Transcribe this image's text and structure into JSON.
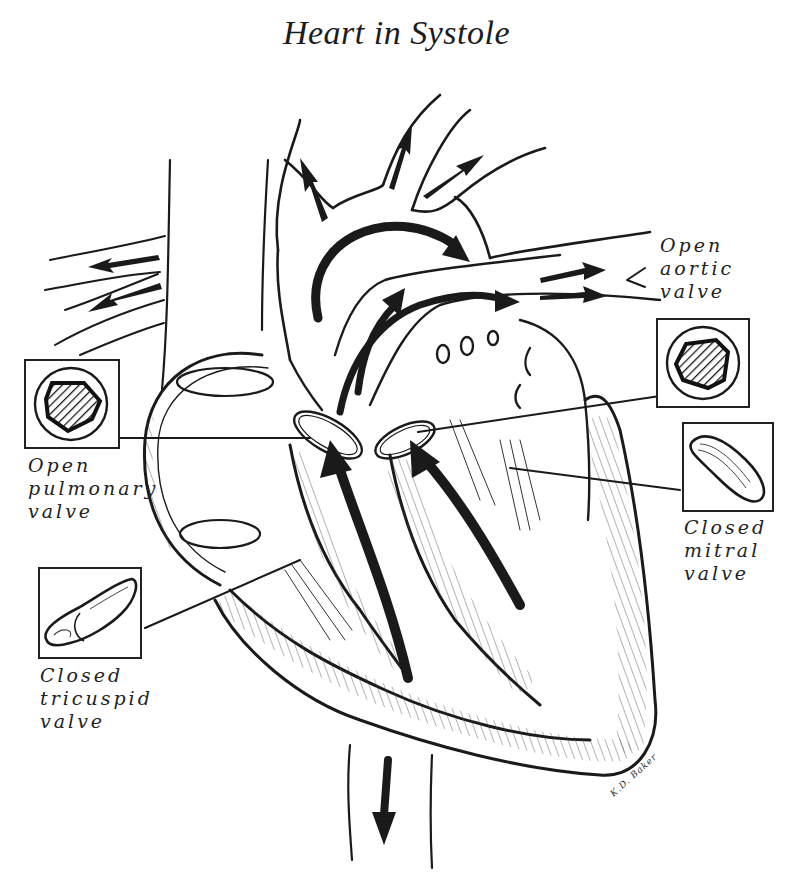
{
  "title": "Heart in Systole",
  "labels": {
    "aortic": [
      "Open",
      "aortic",
      "valve"
    ],
    "pulmonary": [
      "Open",
      "pulmonary",
      "valve"
    ],
    "mitral": [
      "Closed",
      "mitral",
      "valve"
    ],
    "tricuspid": [
      "Closed",
      "tricuspid",
      "valve"
    ]
  },
  "insets": {
    "aortic": "open-aortic-valve-cross-section",
    "pulmonary": "open-pulmonary-valve-cross-section",
    "mitral": "closed-mitral-valve-leaflet",
    "tricuspid": "closed-tricuspid-valve-leaflet"
  },
  "signature": "K.D. Baker",
  "colors": {
    "ink": "#1a1a1a",
    "paper": "#ffffff"
  }
}
